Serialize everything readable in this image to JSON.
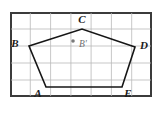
{
  "figure": {
    "frame": {
      "x": 10,
      "y": 12,
      "width": 142,
      "height": 85,
      "border_color": "#3b3b3b",
      "background_color": "#ffffff"
    },
    "grid": {
      "columns": 7,
      "rows": 5,
      "cell_width": 20.28,
      "cell_height": 17,
      "line_color": "#b9b9b9",
      "visible": true,
      "vertical_x": [
        30.3,
        50.6,
        70.9,
        91.1,
        111.4,
        131.7
      ],
      "horizontal_y": [
        29,
        46,
        63,
        80
      ]
    },
    "polygon": {
      "name": "ABCDE",
      "stroke_color": "#161616",
      "fill": "none",
      "closed": true,
      "points_attr": "46,87 29,46 82,29 135,47 122,87",
      "vertices": [
        {
          "label": "A",
          "x": 46,
          "y": 87,
          "label_x": 38,
          "label_y": 97
        },
        {
          "label": "B",
          "x": 29,
          "y": 46,
          "label_x": 15,
          "label_y": 47
        },
        {
          "label": "C",
          "x": 82,
          "y": 29,
          "label_x": 78,
          "label_y": 23
        },
        {
          "label": "D",
          "x": 135,
          "y": 47,
          "label_x": 140,
          "label_y": 49
        },
        {
          "label": "E",
          "x": 122,
          "y": 87,
          "label_x": 126,
          "label_y": 97
        }
      ]
    },
    "interior_point": {
      "label": "B'",
      "x": 73,
      "y": 41,
      "radius": 1.8,
      "color": "#7a7a7a",
      "label_x": 79,
      "label_y": 46
    }
  }
}
